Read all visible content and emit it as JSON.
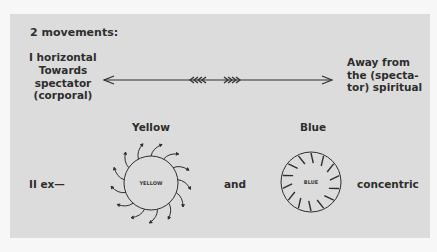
{
  "title": "2 movements:",
  "movement_1": {
    "label": "I  horizontal",
    "left_description": [
      "Towards",
      "spectator",
      "(corporal)"
    ],
    "right_description": [
      "Away from",
      "the (specta-",
      "tor) spiritual"
    ],
    "arrow": {
      "left_chevrons": "‹‹‹‹",
      "right_chevrons": "››››"
    }
  },
  "movement_2": {
    "label": "II  ex—",
    "connector": "and",
    "suffix": "concentric",
    "yellow": {
      "heading": "Yellow",
      "circle_label": "YELLOW",
      "direction": "outward",
      "ray_count": 13
    },
    "blue": {
      "heading": "Blue",
      "circle_label": "BLUE",
      "direction": "inward",
      "tick_count": 14
    }
  },
  "colors": {
    "panel": "#dcdcdc",
    "ink": "#2e2e2e",
    "page": "#f7f7f7"
  }
}
